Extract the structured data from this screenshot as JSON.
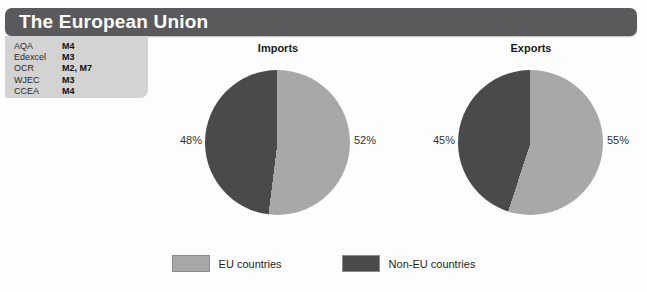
{
  "header": {
    "title": "The European Union"
  },
  "exam_boards": {
    "rows": [
      {
        "board": "AQA",
        "modules": "M4"
      },
      {
        "board": "Edexcel",
        "modules": "M3"
      },
      {
        "board": "OCR",
        "modules": "M2, M7"
      },
      {
        "board": "WJEC",
        "modules": "M3"
      },
      {
        "board": "CCEA",
        "modules": "M4"
      }
    ]
  },
  "colors": {
    "eu": "#a8a8a8",
    "non_eu": "#4a4a4a",
    "title_bar": "#5a5a5c",
    "board_box": "#d3d3d3"
  },
  "legend": {
    "items": [
      {
        "label": "EU countries",
        "color": "#a8a8a8"
      },
      {
        "label": "Non-EU countries",
        "color": "#4a4a4a"
      }
    ]
  },
  "chart_data": [
    {
      "type": "pie",
      "title": "Imports",
      "labels": [
        "EU countries",
        "Non-EU countries"
      ],
      "values": [
        52,
        48
      ],
      "value_labels": [
        "52%",
        "48%"
      ],
      "colors": [
        "#a8a8a8",
        "#4a4a4a"
      ],
      "unit": "%",
      "legend_position": "bottom",
      "start_angle_deg": 0
    },
    {
      "type": "pie",
      "title": "Exports",
      "labels": [
        "EU countries",
        "Non-EU countries"
      ],
      "values": [
        55,
        45
      ],
      "value_labels": [
        "55%",
        "45%"
      ],
      "colors": [
        "#a8a8a8",
        "#4a4a4a"
      ],
      "unit": "%",
      "legend_position": "bottom",
      "start_angle_deg": 0
    }
  ]
}
